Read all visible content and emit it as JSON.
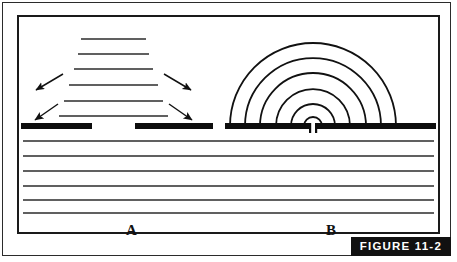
{
  "figure": {
    "tag_label": "FIGURE 11-2",
    "panels": [
      {
        "id": "A",
        "label": "A",
        "kind": "graben-rift-diagram"
      },
      {
        "id": "B",
        "label": "B",
        "kind": "concentric-arc-dome-diagram"
      }
    ]
  },
  "colors": {
    "ink": "#111111",
    "outer_border": "#2b2b2b",
    "inner_border": "#1a1a1a",
    "tag_background": "#111111",
    "tag_text": "#ffffff",
    "paper": "#ffffff"
  },
  "diagram_data": {
    "type": "cross-section-schematic",
    "panel_a": {
      "description": "Horizontal stacked beds narrowing upward with paired divergent arrows and a split surface layer",
      "upper_beds": [
        {
          "index": 1,
          "y": 22,
          "x1": 83,
          "x2": 148
        },
        {
          "index": 2,
          "y": 37,
          "x1": 80,
          "x2": 151
        },
        {
          "index": 3,
          "y": 52,
          "x1": 76,
          "x2": 155
        },
        {
          "index": 4,
          "y": 68,
          "x1": 71,
          "x2": 160
        },
        {
          "index": 5,
          "y": 84,
          "x1": 66,
          "x2": 165
        },
        {
          "index": 6,
          "y": 99,
          "x1": 61,
          "x2": 170
        }
      ],
      "arrows": [
        {
          "from": [
            64,
            58
          ],
          "to": [
            36,
            74
          ],
          "direction": "down-left"
        },
        {
          "from": [
            166,
            58
          ],
          "to": [
            194,
            74
          ],
          "direction": "down-right"
        },
        {
          "from": [
            59,
            88
          ],
          "to": [
            36,
            104
          ],
          "direction": "down-left"
        },
        {
          "from": [
            171,
            88
          ],
          "to": [
            194,
            104
          ],
          "direction": "down-right"
        }
      ],
      "surface_bars": [
        {
          "x1": 2,
          "x2": 75,
          "y": 110
        },
        {
          "x1": 118,
          "x2": 197,
          "y": 110
        }
      ],
      "lower_beds_y": [
        124,
        139,
        154,
        169,
        183,
        196
      ]
    },
    "panel_b": {
      "description": "Six nested semicircular arcs rising from a central vent in the surface layer",
      "center": [
        313,
        110
      ],
      "arcs": [
        {
          "index": 1,
          "radius": 9
        },
        {
          "index": 2,
          "radius": 22
        },
        {
          "index": 3,
          "radius": 37
        },
        {
          "index": 4,
          "radius": 53
        },
        {
          "index": 5,
          "radius": 68
        },
        {
          "index": 6,
          "radius": 83
        }
      ],
      "vent": {
        "x": 313,
        "width": 7,
        "depth": 10
      },
      "surface_bars": [
        {
          "x1": 222,
          "x2": 309,
          "y": 110
        },
        {
          "x1": 317,
          "x2": 421,
          "y": 110
        }
      ],
      "lower_beds_y": [
        124,
        139,
        154,
        169,
        183,
        196
      ]
    },
    "full_width_beds_y": [
      124,
      139,
      154,
      169,
      183,
      196
    ],
    "bed_line_color": "#2b2b2b",
    "surface_bar_color": "#0d0d0d"
  }
}
